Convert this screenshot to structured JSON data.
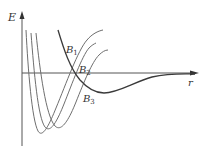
{
  "diagram": {
    "type": "potential-energy-curves",
    "axes": {
      "y_label": "E",
      "x_label": "r"
    },
    "curves": [
      {
        "id": "bound-1",
        "label_main": "B",
        "label_sub": "1"
      },
      {
        "id": "bound-2",
        "label_main": "B",
        "label_sub": "2"
      },
      {
        "id": "bound-3",
        "label_main": "B",
        "label_sub": "3"
      },
      {
        "id": "dissociative",
        "label_main": "",
        "label_sub": ""
      }
    ],
    "colors": {
      "axis": "#555555",
      "bound_curves": "#6e6e6e",
      "dissociative_curve": "#3a3a3a",
      "text": "#333333"
    }
  }
}
